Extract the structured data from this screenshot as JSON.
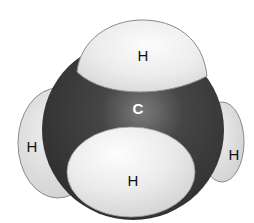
{
  "diagram": {
    "molecule": "methane",
    "model_type": "space-filling",
    "atoms": [
      {
        "id": "h-left",
        "element": "H",
        "label": "H"
      },
      {
        "id": "h-right",
        "element": "H",
        "label": "H"
      },
      {
        "id": "c-center",
        "element": "C",
        "label": "C"
      },
      {
        "id": "h-top",
        "element": "H",
        "label": "H"
      },
      {
        "id": "h-bottom",
        "element": "H",
        "label": "H"
      }
    ],
    "colors": {
      "carbon": "#3a3a3a",
      "carbon_highlight": "#6a6a6a",
      "hydrogen": "#e6e6e6",
      "hydrogen_highlight": "#fafafa",
      "hydrogen_side": "#d4d4d4",
      "outline": "#8a8a8a",
      "label_dark": "#111111",
      "label_light": "#ffffff"
    }
  }
}
